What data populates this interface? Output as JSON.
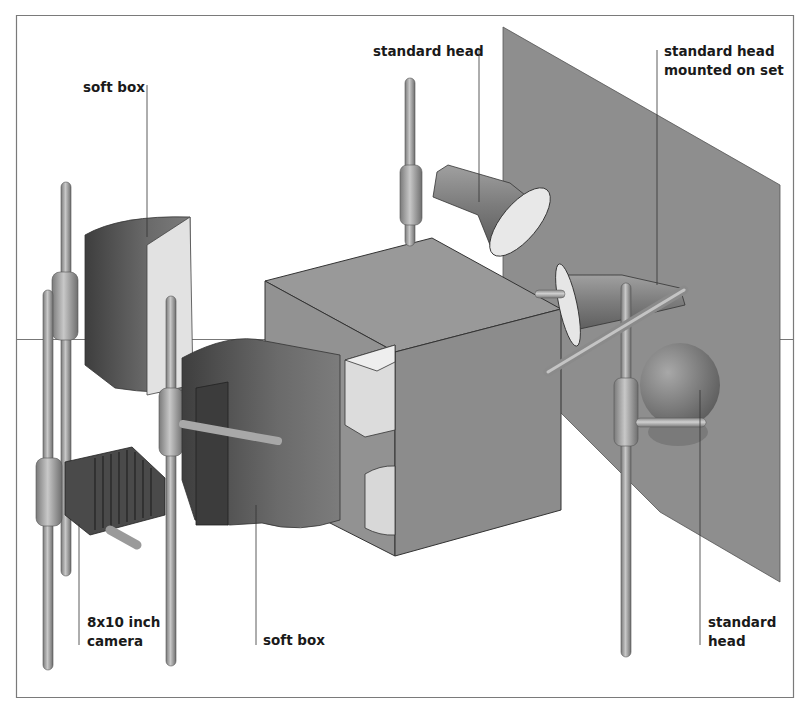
{
  "diagram": {
    "colors": {
      "background": "#ffffff",
      "frame": "#777777",
      "backdrop": "#8e8e8e",
      "box_light": "#9a9a9a",
      "box_dark": "#8a8a8a",
      "softbox": "#6a6a6a",
      "stand": "#9c9c9c",
      "reflector_face": "#e6e6e6",
      "leader_line": "#333333"
    },
    "labels": [
      {
        "id": "soft-box-top",
        "lines": [
          "soft box"
        ]
      },
      {
        "id": "standard-head-top",
        "lines": [
          "standard head"
        ]
      },
      {
        "id": "standard-head-mounted",
        "lines": [
          "standard head",
          "mounted on set"
        ]
      },
      {
        "id": "camera",
        "lines": [
          "8x10 inch",
          "camera"
        ]
      },
      {
        "id": "soft-box-bottom",
        "lines": [
          "soft box"
        ]
      },
      {
        "id": "standard-head-bottom",
        "lines": [
          "standard",
          "head"
        ]
      }
    ]
  }
}
